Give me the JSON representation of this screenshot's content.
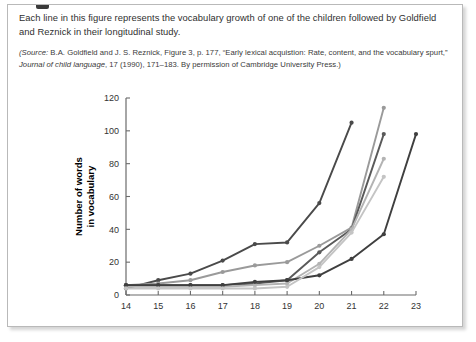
{
  "panel": {
    "caption_main": "Each line in this figure represents the vocabulary growth of one of the children followed by Goldfield and Reznick in their longitudinal study.",
    "source_prefix": "(Source:",
    "source_part1": " B.A. Goldfield and J. S. Reznick, Figure 3, p. 177, “Early lexical acquistion: Rate, content, and the vocabulary spurt,” ",
    "source_journal": "Journal of child language",
    "source_part2": ", 17 (1990), 171–183. By permission of Cambridge University Press.)"
  },
  "chart_data": {
    "type": "line",
    "title": "",
    "xlabel": "Age in months",
    "ylabel": "Number of words in vocabulary",
    "ylabel_line1": "Number of words",
    "ylabel_line2": "in vocabulary",
    "x": [
      14,
      15,
      16,
      17,
      18,
      19,
      20,
      21,
      22,
      23
    ],
    "xlim": [
      14,
      23
    ],
    "ylim": [
      0,
      120
    ],
    "xticks": [
      "14",
      "15",
      "16",
      "17",
      "18",
      "19",
      "20",
      "21",
      "22",
      "23"
    ],
    "yticks": [
      "0",
      "20",
      "40",
      "60",
      "80",
      "100",
      "120"
    ],
    "grid": false,
    "legend": "none",
    "markers": true,
    "series": [
      {
        "name": "child-1",
        "color": "#4a4a4a",
        "x": [
          14,
          15,
          16,
          17,
          18,
          19,
          20,
          21
        ],
        "values": [
          4,
          9,
          13,
          21,
          31,
          32,
          56,
          105
        ]
      },
      {
        "name": "child-2",
        "color": "#9a9a9a",
        "x": [
          14,
          15,
          16,
          17,
          18,
          19,
          20,
          21,
          22
        ],
        "values": [
          6,
          7,
          9,
          14,
          18,
          20,
          30,
          41,
          114
        ]
      },
      {
        "name": "child-3",
        "color": "#5a5a5a",
        "x": [
          14,
          15,
          16,
          17,
          18,
          19,
          20,
          21,
          22
        ],
        "values": [
          6,
          6,
          6,
          6,
          7,
          9,
          26,
          40,
          98
        ]
      },
      {
        "name": "child-4",
        "color": "#b3b3b3",
        "x": [
          14,
          15,
          16,
          17,
          18,
          19,
          20,
          21,
          22
        ],
        "values": [
          5,
          5,
          5,
          5,
          6,
          7,
          19,
          40,
          83
        ]
      },
      {
        "name": "child-5",
        "color": "#3f3f3f",
        "x": [
          14,
          15,
          16,
          17,
          18,
          19,
          20,
          21,
          22,
          23
        ],
        "values": [
          6,
          6,
          6,
          6,
          8,
          9,
          12,
          22,
          37,
          98
        ]
      },
      {
        "name": "child-6",
        "color": "#c4c4c4",
        "x": [
          14,
          15,
          16,
          17,
          18,
          19,
          20,
          21,
          22
        ],
        "values": [
          4,
          4,
          4,
          4,
          4,
          5,
          17,
          38,
          72
        ]
      }
    ]
  },
  "colors": {
    "panel_border": "#b9b9b9",
    "axis": "#6b6b6b",
    "text": "#2f2f2f"
  }
}
